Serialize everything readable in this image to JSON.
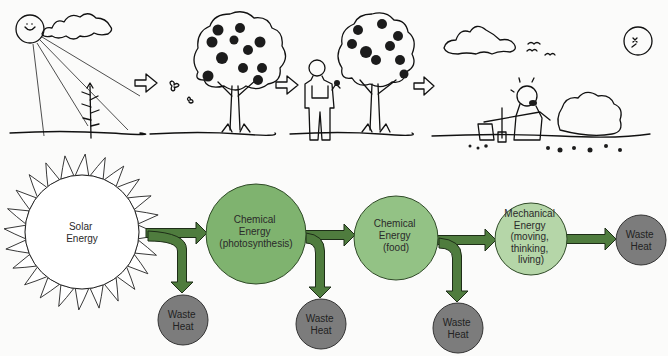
{
  "diagram": {
    "stages": [
      {
        "id": "solar",
        "label_lines": [
          "Solar",
          "Energy"
        ],
        "fill": "#ffffff"
      },
      {
        "id": "photosynthesis",
        "label_lines": [
          "Chemical",
          "Energy",
          "(photosynthesis)"
        ],
        "fill": "#7fb36f"
      },
      {
        "id": "food",
        "label_lines": [
          "Chemical",
          "Energy",
          "(food)"
        ],
        "fill": "#93c285"
      },
      {
        "id": "mechanical",
        "label_lines": [
          "Mechanical",
          "Energy",
          "(moving,",
          "thinking,",
          "living)"
        ],
        "fill": "#b5d6a8"
      }
    ],
    "waste_nodes": [
      {
        "label_lines": [
          "Waste",
          "Heat"
        ],
        "fill": "#7c7c7c"
      },
      {
        "label_lines": [
          "Waste",
          "Heat"
        ],
        "fill": "#7c7c7c"
      },
      {
        "label_lines": [
          "Waste",
          "Heat"
        ],
        "fill": "#7c7c7c"
      },
      {
        "label_lines": [
          "Waste",
          "Heat"
        ],
        "fill": "#7c7c7c"
      }
    ],
    "arrow_color": "#4f7c3e",
    "illustration_panels": [
      "sun-shining-on-seedling",
      "fruit-tree",
      "farmer-eating-fruit",
      "tired-woodcutter"
    ]
  }
}
